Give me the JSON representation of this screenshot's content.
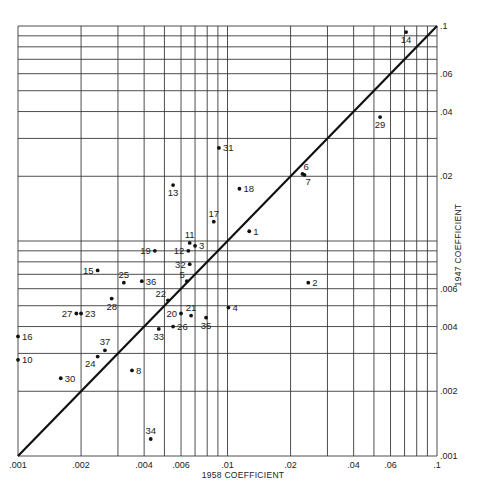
{
  "chart_data": {
    "type": "scatter",
    "title": "",
    "xlabel": "1958 COEFFICIENT",
    "ylabel": "1947 COEFFICIENT",
    "xscale": "log",
    "yscale": "log",
    "xlim": [
      0.001,
      0.1
    ],
    "ylim": [
      0.001,
      0.1
    ],
    "grid": true,
    "reference_line": {
      "type": "y=x",
      "from": [
        0.001,
        0.001
      ],
      "to": [
        0.1,
        0.1
      ]
    },
    "x_ticks": [
      {
        "value": 0.001,
        "label": ".001"
      },
      {
        "value": 0.002,
        "label": ".002"
      },
      {
        "value": 0.004,
        "label": ".004"
      },
      {
        "value": 0.006,
        "label": ".006"
      },
      {
        "value": 0.01,
        "label": ".01"
      },
      {
        "value": 0.02,
        "label": ".02"
      },
      {
        "value": 0.04,
        "label": ".04"
      },
      {
        "value": 0.06,
        "label": ".06"
      },
      {
        "value": 0.1,
        "label": ".1"
      }
    ],
    "y_ticks": [
      {
        "value": 0.001,
        "label": ".001"
      },
      {
        "value": 0.002,
        "label": ".002"
      },
      {
        "value": 0.004,
        "label": ".004"
      },
      {
        "value": 0.006,
        "label": ".006"
      },
      {
        "value": 0.02,
        "label": ".02"
      },
      {
        "value": 0.04,
        "label": ".04"
      },
      {
        "value": 0.06,
        "label": ".06"
      },
      {
        "value": 0.1,
        "label": ".1"
      }
    ],
    "grid_values": [
      0.001,
      0.002,
      0.003,
      0.004,
      0.005,
      0.006,
      0.007,
      0.008,
      0.009,
      0.01,
      0.02,
      0.03,
      0.04,
      0.05,
      0.06,
      0.07,
      0.08,
      0.09,
      0.1
    ],
    "points": [
      {
        "id": "1",
        "x": 0.0127,
        "y": 0.0111,
        "label_pos": "right"
      },
      {
        "id": "2",
        "x": 0.0243,
        "y": 0.0064,
        "label_pos": "right"
      },
      {
        "id": "3",
        "x": 0.007,
        "y": 0.0095,
        "label_pos": "right"
      },
      {
        "id": "4",
        "x": 0.0101,
        "y": 0.0049,
        "label_pos": "right"
      },
      {
        "id": "5",
        "x": 0.0064,
        "y": 0.0065,
        "label_pos": "upleft"
      },
      {
        "id": "6",
        "x": 0.0228,
        "y": 0.0205,
        "label_pos": "upright"
      },
      {
        "id": "7",
        "x": 0.0233,
        "y": 0.0203,
        "label_pos": "downright"
      },
      {
        "id": "8",
        "x": 0.0035,
        "y": 0.0025,
        "label_pos": "right"
      },
      {
        "id": "10",
        "x": 0.001,
        "y": 0.0028,
        "label_pos": "right"
      },
      {
        "id": "11",
        "x": 0.0066,
        "y": 0.0098,
        "label_pos": "above"
      },
      {
        "id": "12",
        "x": 0.0065,
        "y": 0.009,
        "label_pos": "left"
      },
      {
        "id": "13",
        "x": 0.0055,
        "y": 0.0182,
        "label_pos": "below"
      },
      {
        "id": "14",
        "x": 0.0712,
        "y": 0.0937,
        "label_pos": "below"
      },
      {
        "id": "15",
        "x": 0.0024,
        "y": 0.0073,
        "label_pos": "left"
      },
      {
        "id": "16",
        "x": 0.001,
        "y": 0.0036,
        "label_pos": "right"
      },
      {
        "id": "17",
        "x": 0.0086,
        "y": 0.0123,
        "label_pos": "above"
      },
      {
        "id": "18",
        "x": 0.0114,
        "y": 0.0175,
        "label_pos": "right"
      },
      {
        "id": "19",
        "x": 0.0045,
        "y": 0.009,
        "label_pos": "left"
      },
      {
        "id": "20",
        "x": 0.006,
        "y": 0.0046,
        "label_pos": "left"
      },
      {
        "id": "21",
        "x": 0.0067,
        "y": 0.0045,
        "label_pos": "above"
      },
      {
        "id": "22",
        "x": 0.0052,
        "y": 0.0053,
        "label_pos": "upleft"
      },
      {
        "id": "23",
        "x": 0.002,
        "y": 0.0046,
        "label_pos": "right"
      },
      {
        "id": "24",
        "x": 0.0024,
        "y": 0.0029,
        "label_pos": "downleft"
      },
      {
        "id": "25",
        "x": 0.0032,
        "y": 0.0064,
        "label_pos": "above"
      },
      {
        "id": "26",
        "x": 0.0055,
        "y": 0.004,
        "label_pos": "right"
      },
      {
        "id": "27",
        "x": 0.0019,
        "y": 0.0046,
        "label_pos": "left"
      },
      {
        "id": "28",
        "x": 0.0028,
        "y": 0.0054,
        "label_pos": "below"
      },
      {
        "id": "29",
        "x": 0.0535,
        "y": 0.0377,
        "label_pos": "below"
      },
      {
        "id": "30",
        "x": 0.0016,
        "y": 0.0023,
        "label_pos": "right"
      },
      {
        "id": "31",
        "x": 0.0091,
        "y": 0.0271,
        "label_pos": "right"
      },
      {
        "id": "32",
        "x": 0.0066,
        "y": 0.0078,
        "label_pos": "left"
      },
      {
        "id": "33",
        "x": 0.0047,
        "y": 0.0039,
        "label_pos": "below"
      },
      {
        "id": "34",
        "x": 0.0043,
        "y": 0.0012,
        "label_pos": "above"
      },
      {
        "id": "35",
        "x": 0.0079,
        "y": 0.0044,
        "label_pos": "below"
      },
      {
        "id": "36",
        "x": 0.0039,
        "y": 0.0065,
        "label_pos": "right"
      },
      {
        "id": "37",
        "x": 0.0026,
        "y": 0.0031,
        "label_pos": "above"
      }
    ]
  },
  "layout": {
    "plot_left": 18,
    "plot_right": 437,
    "plot_top": 26,
    "plot_bottom": 456
  }
}
